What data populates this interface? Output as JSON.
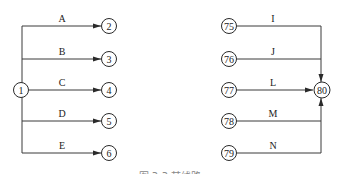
{
  "left_diagram": {
    "source_node": "1",
    "edges": [
      {
        "label": "A",
        "target": "2"
      },
      {
        "label": "B",
        "target": "3"
      },
      {
        "label": "C",
        "target": "4"
      },
      {
        "label": "D",
        "target": "5"
      },
      {
        "label": "E",
        "target": "6"
      }
    ]
  },
  "right_diagram": {
    "sink_node": "80",
    "edges": [
      {
        "label": "I",
        "source": "75"
      },
      {
        "label": "J",
        "source": "76"
      },
      {
        "label": "L",
        "source": "77"
      },
      {
        "label": "M",
        "source": "78"
      },
      {
        "label": "N",
        "source": "79"
      }
    ]
  },
  "caption": "图 3-3 某线路"
}
